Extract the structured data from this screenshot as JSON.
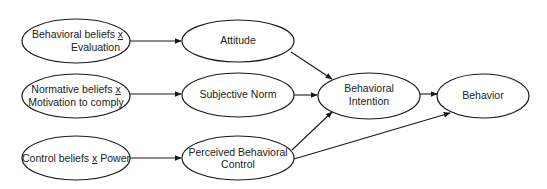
{
  "diagram": {
    "colors": {
      "background": "#ffffff",
      "stroke": "#1a1a1a",
      "text": "#222222"
    },
    "nodes": [
      {
        "id": "behavioral_beliefs",
        "lines": [
          {
            "parts": [
              {
                "text": "Behavioral beliefs ",
                "u": false
              },
              {
                "text": "x",
                "u": true
              }
            ]
          },
          {
            "parts": [
              {
                "text": "Evaluation",
                "u": false
              }
            ]
          }
        ]
      },
      {
        "id": "normative_beliefs",
        "lines": [
          {
            "parts": [
              {
                "text": "Normative beliefs ",
                "u": false
              },
              {
                "text": "x",
                "u": true
              }
            ]
          },
          {
            "parts": [
              {
                "text": "Motivation to comply",
                "u": false
              }
            ]
          }
        ]
      },
      {
        "id": "control_beliefs",
        "lines": [
          {
            "parts": [
              {
                "text": "Control beliefs ",
                "u": false
              },
              {
                "text": "x",
                "u": true
              },
              {
                "text": " Power",
                "u": false
              }
            ]
          }
        ]
      },
      {
        "id": "attitude",
        "lines": [
          {
            "parts": [
              {
                "text": "Attitude",
                "u": false
              }
            ]
          }
        ]
      },
      {
        "id": "subjective_norm",
        "lines": [
          {
            "parts": [
              {
                "text": "Subjective Norm",
                "u": false
              }
            ]
          }
        ]
      },
      {
        "id": "perceived_behavioral_control",
        "lines": [
          {
            "parts": [
              {
                "text": "Perceived Behavioral",
                "u": false
              }
            ]
          },
          {
            "parts": [
              {
                "text": "Control",
                "u": false
              }
            ]
          }
        ]
      },
      {
        "id": "behavioral_intention",
        "lines": [
          {
            "parts": [
              {
                "text": "Behavioral",
                "u": false
              }
            ]
          },
          {
            "parts": [
              {
                "text": "Intention",
                "u": false
              }
            ]
          }
        ]
      },
      {
        "id": "behavior",
        "lines": [
          {
            "parts": [
              {
                "text": "Behavior",
                "u": false
              }
            ]
          }
        ]
      }
    ],
    "edges": [
      {
        "from": "behavioral_beliefs",
        "to": "attitude"
      },
      {
        "from": "normative_beliefs",
        "to": "subjective_norm"
      },
      {
        "from": "control_beliefs",
        "to": "perceived_behavioral_control"
      },
      {
        "from": "attitude",
        "to": "behavioral_intention"
      },
      {
        "from": "subjective_norm",
        "to": "behavioral_intention"
      },
      {
        "from": "perceived_behavioral_control",
        "to": "behavioral_intention"
      },
      {
        "from": "perceived_behavioral_control",
        "to": "behavior"
      },
      {
        "from": "behavioral_intention",
        "to": "behavior"
      }
    ]
  }
}
